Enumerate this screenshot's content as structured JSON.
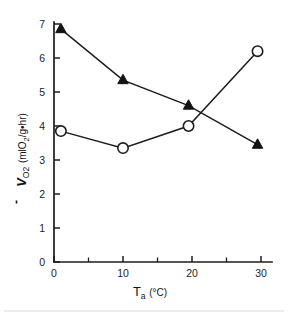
{
  "figure": {
    "background_color": "#ffffff",
    "ink_color": "#1d1d1d"
  },
  "axes": {
    "y_title_main": "V",
    "y_title_sub": "O",
    "y_title_sub2": "2",
    "y_unit_open": "(ml",
    "y_unit_o": "O",
    "y_unit_o_sub": "2",
    "y_unit_rest": "/g",
    "y_unit_dot": "•",
    "y_unit_end": "hr)",
    "x_title_main": "T",
    "x_title_sub": "a",
    "x_unit": "(°C)"
  },
  "chart_data": {
    "type": "line",
    "title": "",
    "xlabel": "Ta (°C)",
    "ylabel": "VO2 (mlO2/g•hr)",
    "xlim": [
      0,
      31
    ],
    "ylim": [
      0,
      7.35
    ],
    "x_ticks": [
      0,
      10,
      20,
      30
    ],
    "x_tick_labels": [
      "0",
      "10",
      "20",
      "30"
    ],
    "x_minor_ticks": [
      5,
      15,
      25
    ],
    "y_ticks": [
      0,
      1,
      2,
      3,
      4,
      5,
      6,
      7
    ],
    "y_tick_labels": [
      "0",
      "1",
      "2",
      "3",
      "4",
      "5",
      "6",
      "7"
    ],
    "grid": false,
    "legend": "none",
    "series": [
      {
        "name": "filled-triangle-series",
        "marker": "triangle-filled",
        "x": [
          1.0,
          10.0,
          19.5,
          29.5
        ],
        "values": [
          6.85,
          5.35,
          4.6,
          3.45
        ]
      },
      {
        "name": "open-circle-series",
        "marker": "circle-open",
        "x": [
          1.0,
          10.0,
          19.5,
          29.5
        ],
        "values": [
          3.85,
          3.35,
          4.0,
          6.2
        ]
      }
    ]
  }
}
